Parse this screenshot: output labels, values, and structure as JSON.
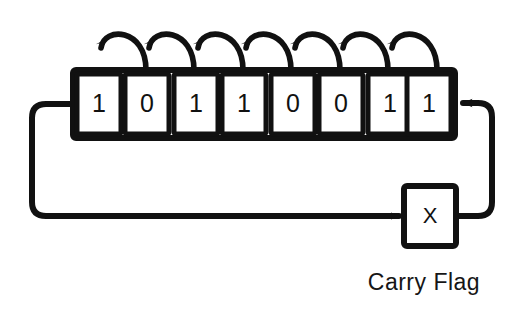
{
  "figure": {
    "background_color": "#ffffff",
    "stroke_color": "#111111",
    "fill_color": "#ffffff"
  },
  "register": {
    "name": "shift-register",
    "bit_count": 8,
    "bits": [
      {
        "index": 0,
        "value": "1"
      },
      {
        "index": 1,
        "value": "0"
      },
      {
        "index": 2,
        "value": "1"
      },
      {
        "index": 3,
        "value": "1"
      },
      {
        "index": 4,
        "value": "0"
      },
      {
        "index": 5,
        "value": "0"
      },
      {
        "index": 6,
        "value": "1"
      },
      {
        "index": 7,
        "value": "1"
      }
    ]
  },
  "shift_arrows": {
    "name": "bit-shift-arrows",
    "count": 7,
    "direction": "right-to-left",
    "icon": "curved-arrow-icon"
  },
  "carry_flag": {
    "name": "carry-flag",
    "value": "X",
    "label": "Carry Flag"
  },
  "loop": {
    "name": "feedback-loop",
    "out_arrow": {
      "name": "carry-in-arrow",
      "icon": "arrowhead-right-icon"
    },
    "in_arrow": {
      "name": "register-in-arrow",
      "icon": "arrowhead-left-icon"
    }
  }
}
